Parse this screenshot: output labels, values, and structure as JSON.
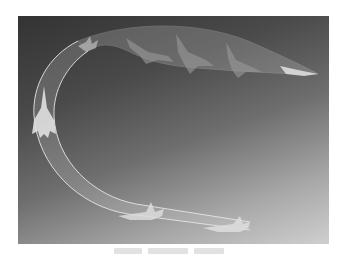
{
  "figure": {
    "colors": {
      "background_dark": "#333333",
      "background_mid": "#6e6e6e",
      "background_light": "#cfcfcf",
      "ribbon_edge": "#e8e8e8",
      "ribbon_fill": "#c8c8c8",
      "aircraft": "#d8d8d8"
    },
    "aircraft_positions": [
      {
        "name": "level-flight-right",
        "x": 208,
        "y": 212
      },
      {
        "name": "level-flight-left",
        "x": 122,
        "y": 200
      },
      {
        "name": "vertical-climb",
        "x": 22,
        "y": 100
      },
      {
        "name": "inverted-top",
        "x": 70,
        "y": 32
      },
      {
        "name": "pitch-1",
        "x": 130,
        "y": 28
      },
      {
        "name": "pitch-2",
        "x": 175,
        "y": 40
      },
      {
        "name": "pitch-3",
        "x": 225,
        "y": 50
      },
      {
        "name": "exit-right",
        "x": 285,
        "y": 56
      }
    ]
  },
  "caption": {
    "text_visible": ""
  }
}
